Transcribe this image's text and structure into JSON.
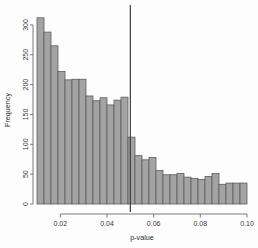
{
  "chart_data": {
    "type": "bar",
    "title": "",
    "subtitle": "",
    "xlabel": "p-value",
    "ylabel": "Frequency",
    "xlim": [
      0.01,
      0.1
    ],
    "ylim": [
      0,
      320
    ],
    "grid": false,
    "legend": null,
    "bin_width": 0.003,
    "x_ticks": [
      0.02,
      0.04,
      0.06,
      0.08,
      0.1
    ],
    "x_tick_labels": [
      "0.02",
      "0.04",
      "0.06",
      "0.08",
      "0.10"
    ],
    "y_ticks": [
      0,
      50,
      100,
      150,
      200,
      250,
      300
    ],
    "y_tick_labels": [
      "0",
      "50",
      "100",
      "150",
      "200",
      "250",
      "300"
    ],
    "bin_starts": [
      0.01,
      0.013,
      0.016,
      0.019,
      0.022,
      0.025,
      0.028,
      0.031,
      0.034,
      0.037,
      0.04,
      0.043,
      0.046,
      0.049,
      0.052,
      0.055,
      0.058,
      0.061,
      0.064,
      0.067,
      0.07,
      0.073,
      0.076,
      0.079,
      0.082,
      0.085,
      0.088,
      0.091,
      0.094,
      0.097
    ],
    "categories": [
      "0.010",
      "0.013",
      "0.016",
      "0.019",
      "0.022",
      "0.025",
      "0.028",
      "0.031",
      "0.034",
      "0.037",
      "0.040",
      "0.043",
      "0.046",
      "0.049",
      "0.052",
      "0.055",
      "0.058",
      "0.061",
      "0.064",
      "0.067",
      "0.070",
      "0.073",
      "0.076",
      "0.079",
      "0.082",
      "0.085",
      "0.088",
      "0.091",
      "0.094",
      "0.097"
    ],
    "values": [
      312,
      288,
      265,
      222,
      208,
      209,
      209,
      181,
      173,
      178,
      166,
      174,
      179,
      112,
      81,
      74,
      78,
      56,
      49,
      49,
      51,
      45,
      43,
      41,
      46,
      51,
      33,
      35,
      35,
      35
    ],
    "annotations": [
      {
        "type": "vertical-line",
        "name": "significance-threshold-line",
        "x": 0.05,
        "color": "#3a3a3a"
      }
    ],
    "colors": {
      "bar_fill": "#a3a3a3",
      "bar_stroke": "#5d5d5d",
      "axis": "#6b6b6b",
      "text": "#2e2e2e",
      "background": "#fdfdfd"
    }
  }
}
